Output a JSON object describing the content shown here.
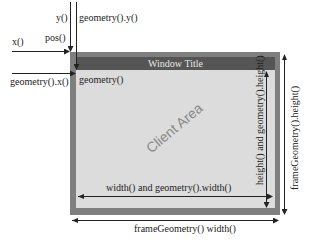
{
  "diagram": {
    "labels": {
      "y": "y()",
      "geometry_y": "geometry().y()",
      "x": "x()",
      "pos": "pos()",
      "geometry_x": "geometry().x()",
      "geometry": "geometry()",
      "window_title": "Window Title",
      "client_area": "Client Area",
      "client_height": "height() and geometry().height()",
      "frame_height": "frameGeometry().height()",
      "client_width": "width() and geometry().width()",
      "frame_width": "frameGeometry() width()"
    },
    "colors": {
      "frame": "#7f7f7f",
      "titlebar": "#555555",
      "client": "#dcdcdc",
      "arrow": "#222222",
      "client_area_text": "#8a8a8a"
    }
  }
}
